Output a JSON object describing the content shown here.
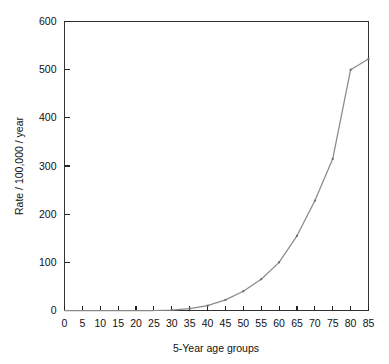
{
  "chart_data": {
    "type": "line",
    "title": "",
    "xlabel": "5-Year age groups",
    "ylabel": "Rate / 100,000 / year",
    "xlim": [
      0,
      85
    ],
    "ylim": [
      0,
      600
    ],
    "grid": false,
    "legend": "none",
    "x_ticks": [
      0,
      5,
      10,
      15,
      20,
      25,
      30,
      35,
      40,
      45,
      50,
      55,
      60,
      65,
      70,
      75,
      80,
      85
    ],
    "x_tick_labels": [
      "0",
      "5",
      "10",
      "15",
      "20",
      "25",
      "30",
      "35",
      "40",
      "45",
      "50",
      "55",
      "60",
      "65",
      "70",
      "75",
      "80",
      "85"
    ],
    "y_ticks": [
      0,
      100,
      200,
      300,
      400,
      500,
      600
    ],
    "y_tick_labels": [
      "0",
      "100",
      "200",
      "300",
      "400",
      "500",
      "600"
    ],
    "series": [
      {
        "name": "rate",
        "color": "#8a8a8a",
        "x": [
          0,
          5,
          10,
          15,
          20,
          25,
          30,
          35,
          40,
          45,
          50,
          55,
          60,
          65,
          70,
          75,
          80,
          85
        ],
        "values": [
          0,
          0,
          0,
          0,
          0,
          0,
          1,
          4,
          10,
          22,
          40,
          65,
          100,
          155,
          228,
          315,
          500,
          522
        ]
      }
    ]
  },
  "axes": {
    "y_axis_title": "Rate / 100,000 / year",
    "x_axis_title": "5-Year age groups"
  }
}
